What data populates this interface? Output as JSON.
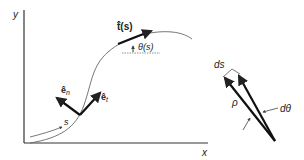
{
  "diagram": {
    "axes": {
      "x_label": "x",
      "y_label": "y"
    },
    "curve": {
      "arc_length_label": "s"
    },
    "tangent": {
      "label": "t̂(s)",
      "angle_label": "θ(s)"
    },
    "frame": {
      "normal_label": "ê",
      "normal_sub": "n",
      "tangent_label": "ê",
      "tangent_sub": "t"
    },
    "curvature": {
      "ds_label": "ds",
      "rho_label": "ρ",
      "dtheta_label": "dθ"
    },
    "colors": {
      "stroke": "#222222",
      "curve": "#555555",
      "background": "#ffffff"
    }
  }
}
